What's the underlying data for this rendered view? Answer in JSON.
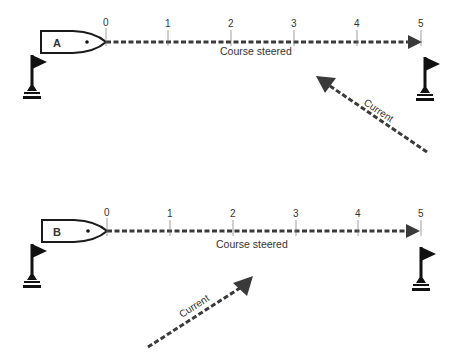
{
  "diagram": {
    "colors": {
      "ink": "#1a1a1a",
      "dash": "#3a3a3a",
      "text": "#333333",
      "background": "#ffffff"
    },
    "scenarios": [
      {
        "id": "A",
        "boat_label": "A",
        "course_label": "Course steered",
        "current_label": "Current",
        "current_direction": "against (from lower right toward upper left)",
        "ticks": [
          "0",
          "1",
          "2",
          "3",
          "4",
          "5"
        ]
      },
      {
        "id": "B",
        "boat_label": "B",
        "course_label": "Course steered",
        "current_label": "Current",
        "current_direction": "with (from lower left toward upper right)",
        "ticks": [
          "0",
          "1",
          "2",
          "3",
          "4",
          "5"
        ]
      }
    ]
  }
}
